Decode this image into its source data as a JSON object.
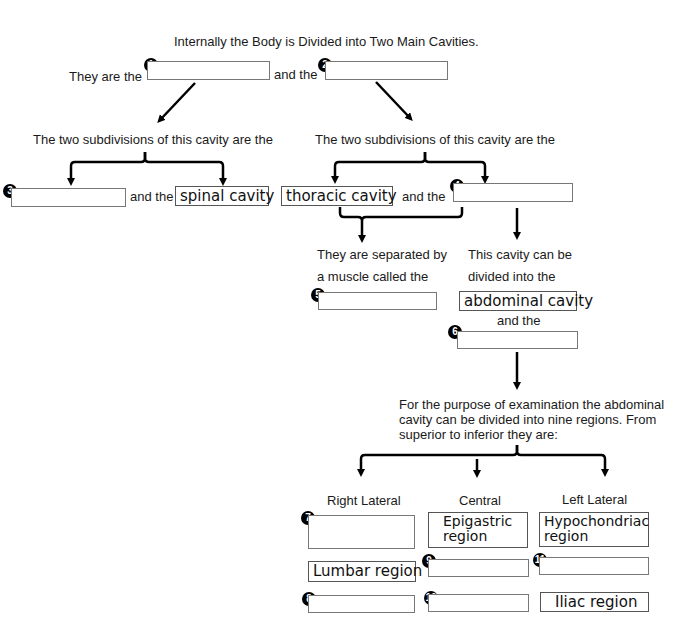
{
  "title": "Internally the Body is Divided into Two Main Cavities.",
  "row1": {
    "prefix": "They are the",
    "mid": "and the",
    "blank1": "1",
    "blank2": "2"
  },
  "left_branch": {
    "heading": "The two subdivisions of this cavity are the",
    "blank3": "3",
    "mid": "and the",
    "given": "spinal cavity"
  },
  "right_branch": {
    "heading": "The two subdivisions of this cavity are the",
    "given": "thoracic cavity",
    "mid": "and the",
    "blank4": "4"
  },
  "separator": {
    "line1": "They are separated by",
    "line2": "a muscle called the",
    "blank5": "5"
  },
  "division": {
    "line1": "This cavity can be",
    "line2": "divided into the",
    "given": "abdominal cavity",
    "mid": "and the",
    "blank6": "6"
  },
  "regions_intro": [
    "For the purpose of examination the abdominal",
    "cavity can be divided into nine regions. From",
    "superior to inferior they are:"
  ],
  "columns": [
    "Right Lateral",
    "Central",
    "Left Lateral"
  ],
  "grid": {
    "r1": {
      "right": "7",
      "central": "Epigastric region",
      "left": "Hypochondriac region"
    },
    "r2": {
      "right": "Lumbar region",
      "central": "9",
      "left": "11"
    },
    "r3": {
      "right": "8",
      "central": "10",
      "left": "Iliac region"
    }
  }
}
